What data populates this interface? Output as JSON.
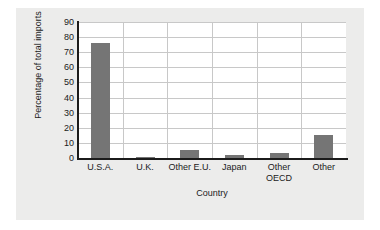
{
  "chart_data": {
    "type": "bar",
    "title": "",
    "xlabel": "Country",
    "ylabel": "Percentage of total imports",
    "categories": [
      "U.S.A.",
      "U.K.",
      "Other E.U.",
      "Japan",
      "Other\nOECD",
      "Other"
    ],
    "values": [
      76,
      1,
      5,
      2,
      3,
      15.5
    ],
    "ylim": [
      0,
      90
    ],
    "yticks": [
      0,
      10,
      20,
      30,
      40,
      50,
      60,
      70,
      80,
      90
    ],
    "ytick_labels": [
      "0",
      "10",
      "20",
      "30",
      "40",
      "50",
      "60",
      "70",
      "80",
      "90"
    ],
    "grid": true,
    "legend": false,
    "bar_color": "#757575",
    "plot_background": "#ffffff",
    "figure_background": "#ececeb",
    "grid_color": "#c8c8c8",
    "axis_color": "#1b1b1b"
  }
}
